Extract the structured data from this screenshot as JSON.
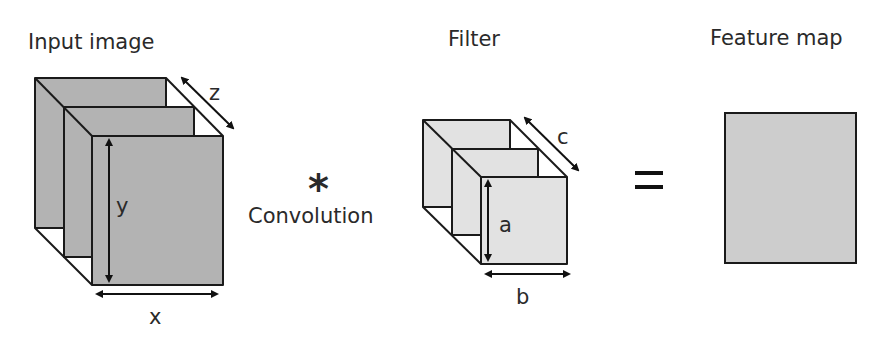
{
  "titles": {
    "input": "Input image",
    "filter": "Filter",
    "output": "Feature map"
  },
  "operators": {
    "convolution_symbol": "*",
    "convolution_label": "Convolution",
    "equals": "="
  },
  "dimensions": {
    "input_width": "x",
    "input_height": "y",
    "input_depth": "z",
    "filter_height": "a",
    "filter_width": "b",
    "filter_depth": "c"
  },
  "colors": {
    "input_fill": "#b3b3b3",
    "filter_fill": "#e2e2e2",
    "feature_fill": "#cdcdcd",
    "stroke": "#1a1a1a"
  }
}
